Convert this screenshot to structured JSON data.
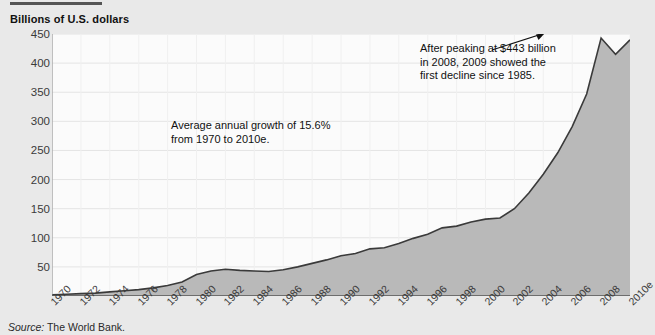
{
  "header": {
    "y_axis_title": "Billions of U.S. dollars"
  },
  "source": {
    "label": "Source:",
    "text": "The World Bank."
  },
  "annotations": {
    "growth": "Average annual growth of 15.6%\nfrom 1970 to 2010e.",
    "peak": "After peaking at $443 billion\nin 2008, 2009 showed the\nfirst decline since 1985."
  },
  "colors": {
    "area_fill": "#b9b9b9",
    "line": "#3a3a3a",
    "plot_background": "#fbfbfb",
    "page_background": "#e9e9e9",
    "gridline": "#e4e4e4",
    "axis": "#8a8a8a"
  },
  "chart_data": {
    "type": "area",
    "title": "",
    "subtitle": "",
    "xlabel": "",
    "ylabel": "Billions of U.S. dollars",
    "ylim": [
      0,
      450
    ],
    "xlim": [
      1970,
      2010
    ],
    "grid": true,
    "legend": "none",
    "y_ticks": [
      0,
      50,
      100,
      150,
      200,
      250,
      300,
      350,
      400,
      450
    ],
    "y_tick_labels": [
      "",
      "50",
      "100",
      "150",
      "200",
      "250",
      "300",
      "350",
      "400",
      "450"
    ],
    "x_tick_labels": [
      "1970",
      "1972",
      "1974",
      "1976",
      "1978",
      "1980",
      "1982",
      "1984",
      "1986",
      "1988",
      "1990",
      "1992",
      "1994",
      "1996",
      "1998",
      "2000",
      "2002",
      "2004",
      "2006",
      "2008",
      "2010e"
    ],
    "categories": [
      1970,
      1971,
      1972,
      1973,
      1974,
      1975,
      1976,
      1977,
      1978,
      1979,
      1980,
      1981,
      1982,
      1983,
      1984,
      1985,
      1986,
      1987,
      1988,
      1989,
      1990,
      1991,
      1992,
      1993,
      1994,
      1995,
      1996,
      1997,
      1998,
      1999,
      2000,
      2001,
      2002,
      2003,
      2004,
      2005,
      2006,
      2007,
      2008,
      2009,
      2010
    ],
    "values": [
      2,
      3,
      4,
      5,
      7,
      9,
      11,
      14,
      18,
      24,
      37,
      43,
      46,
      44,
      43,
      42,
      45,
      50,
      56,
      62,
      69,
      73,
      81,
      83,
      90,
      99,
      106,
      117,
      120,
      127,
      132,
      134,
      150,
      177,
      209,
      246,
      291,
      347,
      443,
      415,
      440
    ],
    "annotations": [
      {
        "text": "Average annual growth of 15.6% from 1970 to 2010e.",
        "x": 1984,
        "y": 280
      },
      {
        "text": "After peaking at $443 billion in 2008, 2009 showed the first decline since 1985.",
        "x": 2002,
        "y": 430,
        "arrow_to_x": 2008,
        "arrow_to_y": 443
      }
    ],
    "notes": {
      "peak_value": 443,
      "peak_year": 2008,
      "average_annual_growth_pct": 15.6,
      "growth_period": "1970 to 2010e",
      "prior_decline_year": 1985
    }
  }
}
